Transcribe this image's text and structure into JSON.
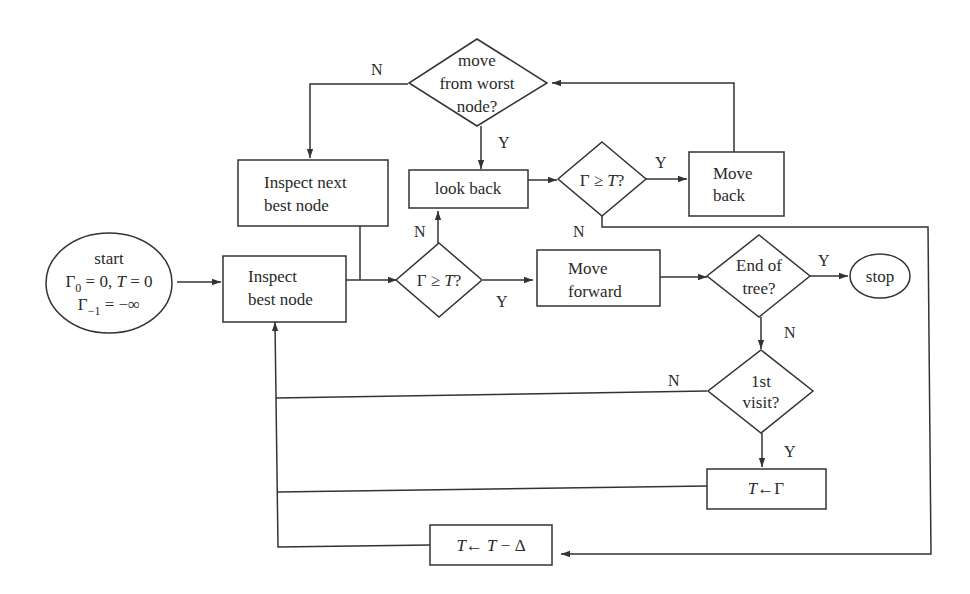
{
  "diagram": {
    "type": "flowchart",
    "nodes": {
      "start": {
        "lines": [
          "start",
          "Γ₀ = 0, T = 0",
          "Γ₋₁ = −∞"
        ],
        "shape": "ellipse"
      },
      "inspect_best": {
        "lines": [
          "Inspect",
          "best node"
        ],
        "shape": "rectangle"
      },
      "inspect_next": {
        "lines": [
          "Inspect next",
          "best node"
        ],
        "shape": "rectangle"
      },
      "decision_gamma_1": {
        "lines": [
          "Γ ≥ T?"
        ],
        "shape": "diamond"
      },
      "look_back": {
        "lines": [
          "look back"
        ],
        "shape": "rectangle"
      },
      "decision_gamma_2": {
        "lines": [
          "Γ ≥ T?"
        ],
        "shape": "diamond"
      },
      "move_back": {
        "lines": [
          "Move",
          "back"
        ],
        "shape": "rectangle"
      },
      "move_from_worst": {
        "lines": [
          "move",
          "from worst",
          "node?"
        ],
        "shape": "diamond"
      },
      "move_forward": {
        "lines": [
          "Move",
          "forward"
        ],
        "shape": "rectangle"
      },
      "end_of_tree": {
        "lines": [
          "End of",
          "tree?"
        ],
        "shape": "diamond"
      },
      "stop": {
        "lines": [
          "stop"
        ],
        "shape": "ellipse"
      },
      "first_visit": {
        "lines": [
          "1st",
          "visit?"
        ],
        "shape": "diamond"
      },
      "set_t_gamma": {
        "text": "T←Γ",
        "shape": "rectangle"
      },
      "decrease_t": {
        "text": "T← T − Δ",
        "shape": "rectangle"
      }
    },
    "edge_labels": {
      "worst_no": "N",
      "worst_yes": "Y",
      "gamma1_no": "N",
      "gamma1_yes": "Y",
      "gamma2_yes": "Y",
      "gamma2_no": "N",
      "end_yes": "Y",
      "end_no": "N",
      "visit_no": "N",
      "visit_yes": "Y"
    },
    "edges": [
      {
        "from": "start",
        "to": "inspect_best"
      },
      {
        "from": "inspect_best",
        "to": "decision_gamma_1"
      },
      {
        "from": "inspect_next",
        "to": "decision_gamma_1"
      },
      {
        "from": "decision_gamma_1",
        "to": "move_forward",
        "label": "Y"
      },
      {
        "from": "decision_gamma_1",
        "to": "look_back",
        "label": "N"
      },
      {
        "from": "look_back",
        "to": "decision_gamma_2"
      },
      {
        "from": "decision_gamma_2",
        "to": "move_back",
        "label": "Y"
      },
      {
        "from": "decision_gamma_2",
        "to": "decrease_t",
        "label": "N"
      },
      {
        "from": "move_back",
        "to": "move_from_worst"
      },
      {
        "from": "move_from_worst",
        "to": "look_back",
        "label": "Y"
      },
      {
        "from": "move_from_worst",
        "to": "inspect_next",
        "label": "N"
      },
      {
        "from": "move_forward",
        "to": "end_of_tree"
      },
      {
        "from": "end_of_tree",
        "to": "stop",
        "label": "Y"
      },
      {
        "from": "end_of_tree",
        "to": "first_visit",
        "label": "N"
      },
      {
        "from": "first_visit",
        "to": "set_t_gamma",
        "label": "Y"
      },
      {
        "from": "first_visit",
        "to": "inspect_best",
        "label": "N"
      },
      {
        "from": "set_t_gamma",
        "to": "inspect_best"
      },
      {
        "from": "decrease_t",
        "to": "inspect_best"
      }
    ]
  }
}
